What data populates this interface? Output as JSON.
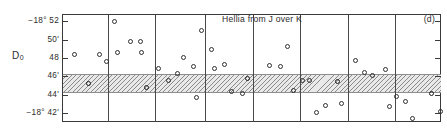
{
  "figure": {
    "panel_tag": "(d)",
    "title": "Hellia from J over K",
    "y_axis_label_main": "D",
    "y_axis_label_sub": "0"
  },
  "axis": {
    "y_ticks": [
      {
        "label": "−18° 52",
        "value": 52.0
      },
      {
        "label": "50'",
        "value": 50.0
      },
      {
        "label": "48",
        "value": 48.0
      },
      {
        "label": "46'",
        "value": 46.0
      },
      {
        "label": "44'",
        "value": 44.0
      },
      {
        "label": "−18° 42'",
        "value": 42.0
      }
    ],
    "ylim": [
      41.0,
      52.8
    ],
    "grid": "off",
    "panel_count": 7
  },
  "band": {
    "label": "reference band",
    "y_top": 46.2,
    "y_bottom": 44.3,
    "fill": "#e9e9e9",
    "hatch": "diagonal"
  },
  "chart_data": {
    "type": "scatter",
    "title": "Hellia from J over K",
    "xlabel": "",
    "ylabel": "D0",
    "ylim": [
      41.0,
      52.8
    ],
    "grid": false,
    "legend": "none",
    "annotations": [
      {
        "text": "(d)",
        "position": "top-right"
      },
      {
        "text": "Hellia from J over K",
        "position": "top-center"
      }
    ],
    "panel_dividers_x": [
      108,
      155,
      205,
      253,
      300,
      348,
      395
    ],
    "marker": "open-circle",
    "series": [
      {
        "name": "D0 observations",
        "points": [
          {
            "x": 74,
            "y": 48.4,
            "bold": false
          },
          {
            "x": 88,
            "y": 45.2,
            "bold": true
          },
          {
            "x": 99,
            "y": 48.4,
            "bold": false
          },
          {
            "x": 106,
            "y": 47.6,
            "bold": false
          },
          {
            "x": 117,
            "y": 48.6,
            "bold": false
          },
          {
            "x": 114,
            "y": 52.0,
            "bold": false
          },
          {
            "x": 130,
            "y": 49.8,
            "bold": false
          },
          {
            "x": 140,
            "y": 49.8,
            "bold": false
          },
          {
            "x": 141,
            "y": 48.6,
            "bold": false
          },
          {
            "x": 146,
            "y": 44.8,
            "bold": true
          },
          {
            "x": 158,
            "y": 46.8,
            "bold": false
          },
          {
            "x": 168,
            "y": 45.5,
            "bold": false
          },
          {
            "x": 177,
            "y": 46.3,
            "bold": false
          },
          {
            "x": 183,
            "y": 48.1,
            "bold": false
          },
          {
            "x": 193,
            "y": 47.1,
            "bold": false
          },
          {
            "x": 196,
            "y": 43.7,
            "bold": false
          },
          {
            "x": 201,
            "y": 51.0,
            "bold": false
          },
          {
            "x": 211,
            "y": 48.9,
            "bold": false
          },
          {
            "x": 214,
            "y": 46.8,
            "bold": false
          },
          {
            "x": 224,
            "y": 47.3,
            "bold": false
          },
          {
            "x": 231,
            "y": 44.3,
            "bold": false
          },
          {
            "x": 242,
            "y": 44.1,
            "bold": false
          },
          {
            "x": 247,
            "y": 45.8,
            "bold": true
          },
          {
            "x": 269,
            "y": 47.2,
            "bold": false
          },
          {
            "x": 280,
            "y": 47.1,
            "bold": false
          },
          {
            "x": 287,
            "y": 49.2,
            "bold": false
          },
          {
            "x": 293,
            "y": 44.4,
            "bold": false
          },
          {
            "x": 302,
            "y": 45.5,
            "bold": false
          },
          {
            "x": 309,
            "y": 45.5,
            "bold": false
          },
          {
            "x": 316,
            "y": 42.0,
            "bold": false
          },
          {
            "x": 325,
            "y": 42.8,
            "bold": false
          },
          {
            "x": 337,
            "y": 45.4,
            "bold": true
          },
          {
            "x": 341,
            "y": 43.0,
            "bold": false
          },
          {
            "x": 355,
            "y": 47.7,
            "bold": false
          },
          {
            "x": 364,
            "y": 46.4,
            "bold": false
          },
          {
            "x": 372,
            "y": 46.1,
            "bold": false
          },
          {
            "x": 385,
            "y": 46.7,
            "bold": false
          },
          {
            "x": 389,
            "y": 42.7,
            "bold": false
          },
          {
            "x": 396,
            "y": 43.8,
            "bold": false
          },
          {
            "x": 405,
            "y": 43.2,
            "bold": false
          },
          {
            "x": 412,
            "y": 41.4,
            "bold": false
          },
          {
            "x": 431,
            "y": 44.1,
            "bold": true
          },
          {
            "x": 440,
            "y": 42.1,
            "bold": false
          }
        ]
      }
    ]
  }
}
